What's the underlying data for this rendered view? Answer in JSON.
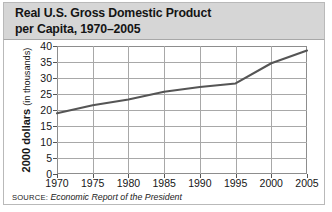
{
  "figure": {
    "title_line1": "Real U.S. Gross Domestic Product",
    "title_line2": "per Capita, 1970–2005",
    "source_label": "SOURCE:",
    "source_reference": "Economic Report of the President",
    "colors": {
      "title_band": "#d6d6d6",
      "line": "#555555",
      "grid": "#a8a8a8",
      "frame": "#8d8d8d",
      "text": "#161616"
    }
  },
  "chart_data": {
    "type": "line",
    "title": "Real U.S. Gross Domestic Product per Capita, 1970–2005",
    "xlabel": "",
    "ylabel": "2000 dollars (in thousands)",
    "ylabel_strong": "2000 dollars",
    "ylabel_light": "(in thousands)",
    "x": [
      1970,
      1975,
      1980,
      1985,
      1990,
      1995,
      2000,
      2005
    ],
    "xtick_labels": [
      "1970",
      "1975",
      "1980",
      "1985",
      "1990",
      "1995",
      "2000",
      "2005"
    ],
    "ytick_labels": [
      "40",
      "35",
      "30",
      "25",
      "20",
      "15",
      "10",
      "5",
      "0"
    ],
    "yticks": [
      40,
      35,
      30,
      25,
      20,
      15,
      10,
      5,
      0
    ],
    "xlim": [
      1970,
      2005
    ],
    "ylim": [
      0,
      40
    ],
    "grid": true,
    "legend": false,
    "series": [
      {
        "name": "Real GDP per capita",
        "values": [
          19.0,
          21.5,
          23.3,
          25.7,
          27.2,
          28.3,
          34.6,
          38.6
        ]
      }
    ]
  }
}
